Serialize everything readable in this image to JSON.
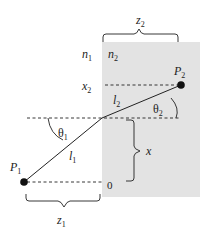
{
  "diagram": {
    "colors": {
      "medium2_fill": "#e3e3e3",
      "line": "#222222",
      "background": "#ffffff"
    },
    "media": [
      {
        "id": "n1",
        "label": "n",
        "subscript": "1"
      },
      {
        "id": "n2",
        "label": "n",
        "subscript": "2"
      }
    ],
    "points": [
      {
        "id": "P1",
        "label": "P",
        "subscript": "1"
      },
      {
        "id": "P2",
        "label": "P",
        "subscript": "2"
      }
    ],
    "segments": [
      {
        "id": "l1",
        "label": "l",
        "subscript": "1"
      },
      {
        "id": "l2",
        "label": "l",
        "subscript": "2"
      }
    ],
    "angles": [
      {
        "id": "theta1",
        "label": "θ",
        "subscript": "1"
      },
      {
        "id": "theta2",
        "label": "θ",
        "subscript": "2"
      }
    ],
    "dimensions": {
      "z1": {
        "label": "z",
        "subscript": "1"
      },
      "z2": {
        "label": "z",
        "subscript": "2"
      },
      "x": {
        "label": "x"
      },
      "x2": {
        "label": "x",
        "subscript": "2"
      },
      "origin": {
        "label": "0"
      }
    }
  }
}
